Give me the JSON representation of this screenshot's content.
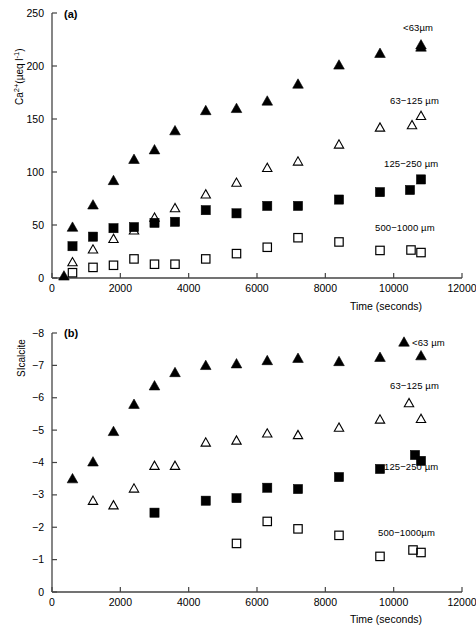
{
  "figure": {
    "panels": [
      {
        "tag": "(a)",
        "ylabel_html": "Ca<sup>2+</sup>(µeq l<sup>-1</sup>)",
        "ylabel_text": "Ca2+ (ueq l-1)",
        "xlabel": "Time (seconds)",
        "yticks": [
          "0",
          "50",
          "100",
          "150",
          "200",
          "250"
        ],
        "xticks": [
          "0",
          "2000",
          "4000",
          "6000",
          "8000",
          "10000",
          "12000"
        ],
        "series_labels": [
          "<63µm",
          "63−25µm",
          "125−250µm",
          "500−1000 µm"
        ]
      },
      {
        "tag": "(b)",
        "ylabel_html": "SIcalcite",
        "ylabel_text": "SIcalcite",
        "xlabel": "Time (seconds)",
        "yticks": [
          "0",
          "−1",
          "−2",
          "−3",
          "−4",
          "−5",
          "−6",
          "−7",
          "−8"
        ],
        "xticks": [
          "0",
          "2000",
          "4000",
          "6000",
          "8000",
          "10000",
          "12000"
        ],
        "series_labels": [
          "<63 µm",
          "63−125 µm",
          "125−250 µm",
          "500−1000µm"
        ]
      }
    ]
  },
  "labels": {
    "panel_a_tag": "(a)",
    "panel_b_tag": "(b)",
    "panel_a_legend_1": "<63µm",
    "panel_a_legend_2": "63−125 µm",
    "panel_a_legend_3": "125−250 µm",
    "panel_a_legend_4": "500−1000 µm",
    "panel_b_legend_1": "<63 µm",
    "panel_b_legend_2": "63−125 µm",
    "panel_b_legend_3": "125−250 µm",
    "panel_b_legend_4": "500−1000µm",
    "xlabel_a": "Time (seconds)",
    "xlabel_b": "Time (seconds)",
    "ylabel_b": "SIcalcite"
  },
  "chart_data": [
    {
      "id": "panel-a",
      "type": "scatter",
      "title": "(a)",
      "xlabel": "Time (seconds)",
      "ylabel": "Ca2+ (µeq l-1)",
      "xlim": [
        0,
        12000
      ],
      "ylim": [
        0,
        250
      ],
      "xticks": [
        0,
        2000,
        4000,
        6000,
        8000,
        10000,
        12000
      ],
      "yticks": [
        0,
        50,
        100,
        150,
        200,
        250
      ],
      "grid": false,
      "legend_position": "right-inside",
      "series": [
        {
          "name": "<63µm",
          "marker": "filled-triangle",
          "color": "#000000",
          "x": [
            350,
            600,
            1200,
            1800,
            2400,
            3000,
            3600,
            4500,
            5400,
            6300,
            7200,
            8400,
            9600,
            10800
          ],
          "y": [
            2,
            48,
            69,
            92,
            112,
            121,
            139,
            158,
            160,
            167,
            183,
            201,
            212,
            220
          ]
        },
        {
          "name": "63−125 µm",
          "marker": "open-triangle",
          "color": "#000000",
          "x": [
            600,
            1200,
            1800,
            2400,
            3000,
            3600,
            4500,
            5400,
            6300,
            7200,
            8400,
            9600,
            10800
          ],
          "y": [
            15,
            27,
            37,
            45,
            57,
            66,
            79,
            90,
            104,
            110,
            126,
            142,
            153
          ]
        },
        {
          "name": "125−250 µm",
          "marker": "filled-square",
          "color": "#000000",
          "x": [
            600,
            1200,
            1800,
            2400,
            3000,
            3600,
            4500,
            5400,
            6300,
            7200,
            8400,
            9600,
            10800
          ],
          "y": [
            30,
            39,
            47,
            48,
            52,
            53,
            64,
            61,
            68,
            68,
            74,
            81,
            93
          ]
        },
        {
          "name": "500−1000 µm",
          "marker": "open-square",
          "color": "#000000",
          "x": [
            600,
            1200,
            1800,
            2400,
            3000,
            3600,
            4500,
            5400,
            6300,
            7200,
            8400,
            9600,
            10800
          ],
          "y": [
            5,
            10,
            12,
            18,
            13,
            13,
            18,
            23,
            29,
            38,
            34,
            26,
            24
          ]
        }
      ]
    },
    {
      "id": "panel-b",
      "type": "scatter",
      "title": "(b)",
      "xlabel": "Time (seconds)",
      "ylabel": "SIcalcite",
      "xlim": [
        0,
        12000
      ],
      "ylim": [
        0,
        -8
      ],
      "y_axis_inverted": true,
      "xticks": [
        0,
        2000,
        4000,
        6000,
        8000,
        10000,
        12000
      ],
      "yticks": [
        0,
        -1,
        -2,
        -3,
        -4,
        -5,
        -6,
        -7,
        -8
      ],
      "grid": false,
      "legend_position": "right-inside",
      "series": [
        {
          "name": "<63 µm",
          "marker": "filled-triangle",
          "color": "#000000",
          "x": [
            600,
            1200,
            1800,
            2400,
            3000,
            3600,
            4500,
            5400,
            6300,
            7200,
            8400,
            9600,
            10800
          ],
          "y": [
            -3.5,
            -4.02,
            -4.96,
            -5.8,
            -6.37,
            -6.78,
            -7.0,
            -7.05,
            -7.15,
            -7.22,
            -7.12,
            -7.25,
            -7.3
          ]
        },
        {
          "name": "63−125 µm",
          "marker": "open-triangle",
          "color": "#000000",
          "x": [
            1200,
            1800,
            2400,
            3000,
            3600,
            4500,
            5400,
            6300,
            7200,
            8400,
            9600,
            10800
          ],
          "y": [
            -2.82,
            -2.68,
            -3.2,
            -3.9,
            -3.9,
            -4.62,
            -4.68,
            -4.9,
            -4.85,
            -5.08,
            -5.33,
            -5.35
          ]
        },
        {
          "name": "125−250 µm",
          "marker": "filled-square",
          "color": "#000000",
          "x": [
            3000,
            4500,
            5400,
            6300,
            7200,
            8400,
            9600,
            10800
          ],
          "y": [
            -2.45,
            -2.82,
            -2.9,
            -3.22,
            -3.18,
            -3.55,
            -3.8,
            -4.05
          ]
        },
        {
          "name": "500−1000µm",
          "marker": "open-square",
          "color": "#000000",
          "x": [
            5400,
            6300,
            7200,
            8400,
            9600,
            10800
          ],
          "y": [
            -1.5,
            -2.18,
            -1.95,
            -1.75,
            -1.1,
            -1.22
          ]
        }
      ]
    }
  ]
}
